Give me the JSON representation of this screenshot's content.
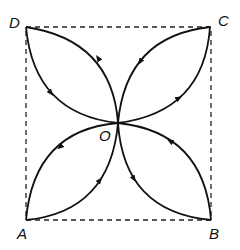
{
  "diagram": {
    "type": "square with four lens-shaped loops meeting at center",
    "labels": {
      "A": "A",
      "B": "B",
      "C": "C",
      "D": "D",
      "O": "O"
    },
    "corners": {
      "D": [
        26,
        27
      ],
      "C": [
        210,
        27
      ],
      "A": [
        26,
        220
      ],
      "B": [
        211,
        220
      ]
    },
    "center": [
      118,
      123
    ],
    "square_style": "dashed",
    "loops": [
      {
        "between": [
          "O",
          "D"
        ],
        "outer_arc_direction": "O to D",
        "inner_arc_direction": "D to O"
      },
      {
        "between": [
          "O",
          "C"
        ],
        "outer_arc_direction": "O to C",
        "inner_arc_direction": "C to O"
      },
      {
        "between": [
          "O",
          "A"
        ],
        "outer_arc_direction": "O to A",
        "inner_arc_direction": "A to O"
      },
      {
        "between": [
          "O",
          "B"
        ],
        "outer_arc_direction": "O to B",
        "inner_arc_direction": "B to O"
      }
    ],
    "colors": {
      "line": "#111111",
      "background": "#ffffff"
    }
  }
}
